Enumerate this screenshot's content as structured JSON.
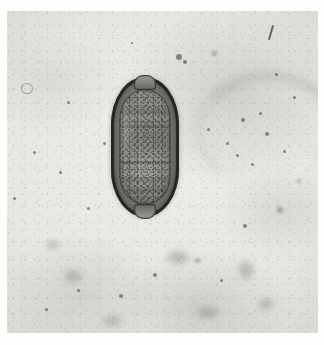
{
  "image": {
    "kind": "light-microscopy-photomicrograph",
    "medium": "black-and-white photographic print",
    "width_px": 324,
    "height_px": 345,
    "subject": "Trichuris trichiura (whipworm) egg",
    "subject_common_name": "whipworm ovum",
    "morphology": "barrel-shaped (lemon-shaped) egg with thick smooth shell and bipolar mucoid plugs",
    "stain": "unstained wet mount",
    "background_description": "pale mottled gray field with scattered dark debris specks and out-of-focus smudges",
    "visible_text": "",
    "artifacts": [
      "thin diagonal emulsion scratch at upper right",
      "white paper border around print"
    ]
  },
  "colors": {
    "paper_white": "#fdfdfc",
    "field_light": "#ededea",
    "field_mid": "#e4e4e1",
    "field_dark": "#dcdcd8",
    "shell_outline": "#1e1e1c",
    "shell_body": "#4a4a47",
    "ovum_interior": "#7c7c79",
    "plug_highlight": "#9a9a96",
    "debris": "#464644"
  },
  "print_area": {
    "left": 7,
    "top": 11,
    "width": 311,
    "height": 322
  },
  "egg": {
    "label": "Trichuris egg",
    "left": 111,
    "top": 77,
    "width": 68,
    "height": 140,
    "bands": [
      18,
      31,
      63,
      78,
      86
    ],
    "plug_top_label": "polar mucoid plug (anterior)",
    "plug_bottom_label": "polar mucoid plug (posterior)",
    "shell_label": "egg shell",
    "interior_label": "granular ovum contents"
  },
  "debris": [
    {
      "left": 14,
      "top": 72,
      "w": 10,
      "h": 9,
      "style": "ring"
    },
    {
      "left": 60,
      "top": 90,
      "w": 3,
      "h": 3,
      "style": "solid"
    },
    {
      "left": 169,
      "top": 43,
      "w": 6,
      "h": 6,
      "style": "solid"
    },
    {
      "left": 176,
      "top": 49,
      "w": 4,
      "h": 4,
      "style": "solid"
    },
    {
      "left": 205,
      "top": 40,
      "w": 5,
      "h": 5,
      "style": "soft"
    },
    {
      "left": 124,
      "top": 31,
      "w": 2,
      "h": 2,
      "style": "solid"
    },
    {
      "left": 234,
      "top": 107,
      "w": 4,
      "h": 4,
      "style": "solid"
    },
    {
      "left": 252,
      "top": 101,
      "w": 3,
      "h": 3,
      "style": "solid"
    },
    {
      "left": 258,
      "top": 121,
      "w": 4,
      "h": 4,
      "style": "solid"
    },
    {
      "left": 219,
      "top": 131,
      "w": 3,
      "h": 3,
      "style": "solid"
    },
    {
      "left": 229,
      "top": 143,
      "w": 3,
      "h": 3,
      "style": "solid"
    },
    {
      "left": 244,
      "top": 152,
      "w": 3,
      "h": 3,
      "style": "solid"
    },
    {
      "left": 200,
      "top": 117,
      "w": 3,
      "h": 3,
      "style": "solid"
    },
    {
      "left": 276,
      "top": 139,
      "w": 3,
      "h": 3,
      "style": "solid"
    },
    {
      "left": 290,
      "top": 168,
      "w": 4,
      "h": 4,
      "style": "soft"
    },
    {
      "left": 270,
      "top": 196,
      "w": 6,
      "h": 6,
      "style": "soft"
    },
    {
      "left": 236,
      "top": 213,
      "w": 4,
      "h": 4,
      "style": "solid"
    },
    {
      "left": 188,
      "top": 247,
      "w": 5,
      "h": 5,
      "style": "soft"
    },
    {
      "left": 213,
      "top": 268,
      "w": 3,
      "h": 3,
      "style": "solid"
    },
    {
      "left": 146,
      "top": 262,
      "w": 4,
      "h": 4,
      "style": "solid"
    },
    {
      "left": 112,
      "top": 283,
      "w": 4,
      "h": 4,
      "style": "solid"
    },
    {
      "left": 70,
      "top": 278,
      "w": 3,
      "h": 3,
      "style": "solid"
    },
    {
      "left": 38,
      "top": 297,
      "w": 3,
      "h": 3,
      "style": "solid"
    },
    {
      "left": 58,
      "top": 259,
      "w": 16,
      "h": 12,
      "style": "hazy"
    },
    {
      "left": 160,
      "top": 240,
      "w": 22,
      "h": 13,
      "style": "hazy"
    },
    {
      "left": 232,
      "top": 250,
      "w": 14,
      "h": 18,
      "style": "hazy"
    },
    {
      "left": 96,
      "top": 305,
      "w": 18,
      "h": 10,
      "style": "hazy"
    },
    {
      "left": 191,
      "top": 296,
      "w": 20,
      "h": 11,
      "style": "hazy"
    },
    {
      "left": 252,
      "top": 288,
      "w": 14,
      "h": 10,
      "style": "hazy"
    },
    {
      "left": 26,
      "top": 140,
      "w": 3,
      "h": 3,
      "style": "solid"
    },
    {
      "left": 52,
      "top": 160,
      "w": 3,
      "h": 3,
      "style": "solid"
    },
    {
      "left": 80,
      "top": 196,
      "w": 3,
      "h": 3,
      "style": "solid"
    },
    {
      "left": 40,
      "top": 230,
      "w": 12,
      "h": 8,
      "style": "hazy"
    },
    {
      "left": 96,
      "top": 131,
      "w": 3,
      "h": 3,
      "style": "solid"
    },
    {
      "left": 6,
      "top": 186,
      "w": 3,
      "h": 3,
      "style": "solid"
    },
    {
      "left": 268,
      "top": 62,
      "w": 3,
      "h": 3,
      "style": "solid"
    },
    {
      "left": 286,
      "top": 85,
      "w": 3,
      "h": 3,
      "style": "solid"
    }
  ],
  "scratch": {
    "label": "emulsion-scratch",
    "left": 270,
    "top": 25
  }
}
